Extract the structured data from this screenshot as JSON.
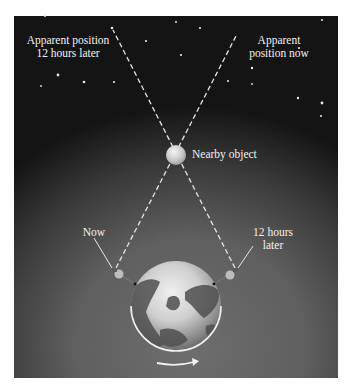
{
  "figure": {
    "labels": {
      "apparent_later": "Apparent position\n12 hours later",
      "apparent_now": "Apparent\nposition now",
      "nearby_object": "Nearby object",
      "now": "Now",
      "later": "12 hours\nlater"
    },
    "colors": {
      "sky_dark": "#141414",
      "sky_light": "#6e6e6e",
      "line": "#e6e6e6",
      "text": "#f2f2f2",
      "object": "#d8d8d8"
    },
    "geometry": {
      "object_center": [
        176,
        155
      ],
      "object_radius": 10,
      "globe_center": [
        176,
        306
      ],
      "globe_radius": 45,
      "observer_now": [
        116,
        272
      ],
      "observer_later": [
        235,
        272
      ],
      "line_now_end": [
        236,
        36
      ],
      "line_later_end": [
        113,
        28
      ]
    },
    "stars": [
      [
        45,
        16
      ],
      [
        58,
        53
      ],
      [
        112,
        28
      ],
      [
        124,
        40
      ],
      [
        146,
        62
      ],
      [
        128,
        84
      ],
      [
        99,
        84
      ],
      [
        43,
        75
      ],
      [
        176,
        22
      ],
      [
        200,
        27
      ],
      [
        209,
        32
      ],
      [
        181,
        53
      ],
      [
        199,
        70
      ],
      [
        255,
        68
      ],
      [
        299,
        48
      ],
      [
        317,
        101
      ],
      [
        302,
        106
      ],
      [
        285,
        84
      ],
      [
        232,
        97
      ],
      [
        322,
        20
      ],
      [
        35,
        88
      ]
    ]
  }
}
